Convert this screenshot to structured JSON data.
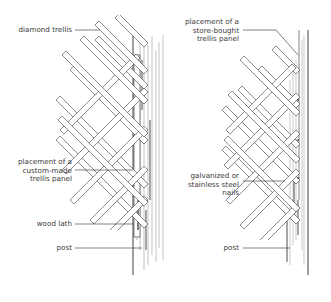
{
  "diagram": {
    "colors": {
      "ink": "#2b2b2b",
      "text": "#3a3a3a",
      "background": "#ffffff"
    },
    "left_panel": {
      "title": "custom-made trellis mounting",
      "labels": [
        {
          "id": "diamond-trellis",
          "text": "diamond trellis"
        },
        {
          "id": "custom-panel",
          "lines": [
            "placement of a",
            "custom-made",
            "trellis panel"
          ]
        },
        {
          "id": "wood-lath",
          "text": "wood lath"
        },
        {
          "id": "post",
          "text": "post"
        }
      ]
    },
    "right_panel": {
      "title": "store-bought trellis mounting",
      "labels": [
        {
          "id": "store-panel",
          "lines": [
            "placement of a",
            "store-bought",
            "trellis panel"
          ]
        },
        {
          "id": "nails",
          "lines": [
            "galvanized or",
            "stainless steel",
            "nails"
          ]
        },
        {
          "id": "post",
          "text": "post"
        }
      ]
    }
  }
}
